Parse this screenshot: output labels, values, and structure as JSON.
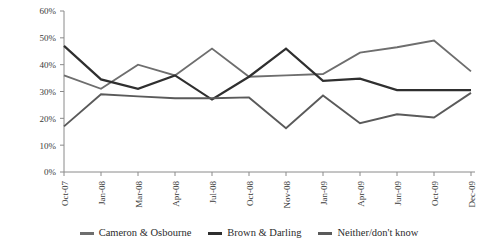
{
  "chart_data": {
    "type": "line",
    "title": "",
    "xlabel": "",
    "ylabel": "",
    "ylim": [
      0,
      60
    ],
    "ytick_labels": [
      "0%",
      "10%",
      "20%",
      "30%",
      "40%",
      "50%",
      "60%"
    ],
    "ytick_values": [
      0,
      10,
      20,
      30,
      40,
      50,
      60
    ],
    "grid": false,
    "legend_position": "bottom",
    "categories": [
      "Oct-07",
      "Jan-08",
      "Mar-08",
      "Apr-08",
      "Jul-08",
      "Oct-08",
      "Nov-08",
      "Jan-09",
      "Apr-09",
      "Jun-09",
      "Oct-09",
      "Dec-09"
    ],
    "series": [
      {
        "name": "Cameron & Osbourne",
        "color": "#6e6e6e",
        "values": [
          36,
          31,
          40,
          36,
          46,
          35.5,
          36,
          36.5,
          44.5,
          46.5,
          49,
          37.5
        ]
      },
      {
        "name": "Brown & Darling",
        "color": "#2f2f2f",
        "values": [
          47,
          34.5,
          31,
          36,
          27,
          35.5,
          46,
          34,
          34.8,
          30.5,
          30.5,
          30.5
        ]
      },
      {
        "name": "Neither/don't know",
        "color": "#5a5a5a",
        "values": [
          17,
          29,
          28.2,
          27.5,
          27.5,
          27.8,
          16.3,
          28.5,
          18.2,
          21.5,
          20.3,
          29.5
        ]
      }
    ]
  },
  "legend": {
    "items": [
      {
        "label": "Cameron & Osbourne",
        "color": "#6e6e6e"
      },
      {
        "label": "Brown & Darling",
        "color": "#2f2f2f"
      },
      {
        "label": "Neither/don't know",
        "color": "#5a5a5a"
      }
    ]
  }
}
